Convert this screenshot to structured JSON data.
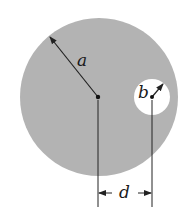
{
  "diagram": {
    "colors": {
      "fill": "#b3b3b3",
      "hole": "#ffffff",
      "line": "#222222"
    },
    "labels": {
      "outer_radius": "a",
      "hole_radius": "b",
      "offset": "d"
    }
  }
}
